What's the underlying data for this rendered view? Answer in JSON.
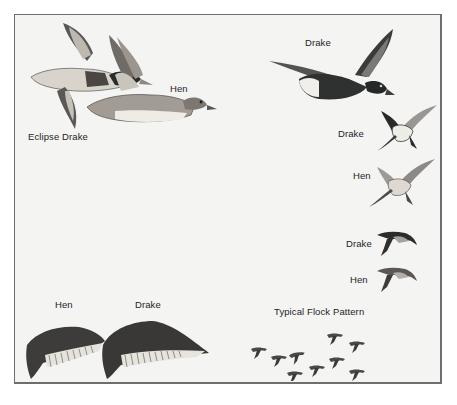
{
  "plate": {
    "labels": {
      "top_left_hen": "Hen",
      "eclipse_drake": "Eclipse Drake",
      "top_right_drake": "Drake",
      "right_drake_underside": "Drake",
      "right_hen_underside": "Hen",
      "small_drake": "Drake",
      "small_hen": "Hen",
      "wing_hen": "Hen",
      "wing_drake": "Drake",
      "flock": "Typical Flock Pattern"
    },
    "colors": {
      "background": "#f4f4f3",
      "frame": "#6e6e6e",
      "dark_plumage": "#2f3030",
      "mid_plumage": "#8a8784",
      "light_plumage": "#e9e7e2"
    }
  }
}
